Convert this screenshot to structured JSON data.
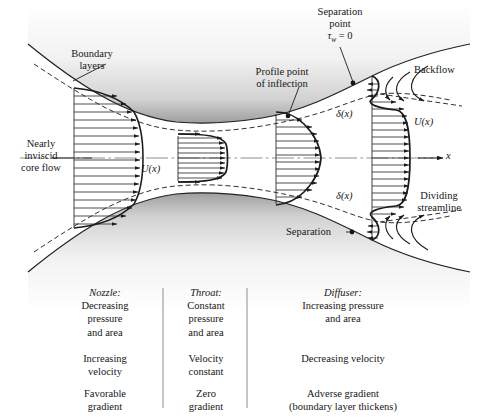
{
  "figure": {
    "axis_label": "x",
    "labels": {
      "boundary_layers": "Boundary\nlayers",
      "boundary_layers_l1": "Boundary",
      "boundary_layers_l2": "layers",
      "nearly_inviscid_l1": "Nearly",
      "nearly_inviscid_l2": "inviscid",
      "nearly_inviscid_l3": "core flow",
      "profile_inflection_l1": "Profile point",
      "profile_inflection_l2": "of inflection",
      "separation_point_l1": "Separation",
      "separation_point_l2": "point",
      "separation_point_l3": "τw = 0",
      "backflow": "Backflow",
      "dividing_streamline_l1": "Dividing",
      "dividing_streamline_l2": "streamline",
      "separation": "Separation",
      "delta_upper": "δ(x)",
      "delta_lower": "δ(x)",
      "u_inlet": "U(x)",
      "u_diffuser": "U(x)",
      "u_exit": "U(x)",
      "x_axis": "x"
    },
    "colors": {
      "ink": "#161616",
      "wall_shade_dark": "#a8a8a8",
      "wall_shade_light": "#ffffff",
      "profile_line": "#3a3a3a",
      "dashed": "#2b2b2b",
      "centerline": "#8a8a8a"
    }
  },
  "table": {
    "dividers": 2,
    "columns": [
      {
        "id": "nozzle",
        "heading": "Nozzle:",
        "rows": [
          [
            "Decreasing",
            "pressure",
            "and area"
          ],
          [
            "Increasing",
            "velocity"
          ],
          [
            "Favorable",
            "gradient"
          ]
        ]
      },
      {
        "id": "throat",
        "heading": "Throat:",
        "rows": [
          [
            "Constant",
            "pressure",
            "and area"
          ],
          [
            "Velocity",
            "constant"
          ],
          [
            "Zero",
            "gradient"
          ]
        ]
      },
      {
        "id": "diffuser",
        "heading": "Diffuser:",
        "rows": [
          [
            "Increasing pressure",
            "and area"
          ],
          [
            "Decreasing velocity"
          ],
          [
            "Adverse gradient",
            "(boundary layer thickens)"
          ]
        ]
      }
    ]
  }
}
